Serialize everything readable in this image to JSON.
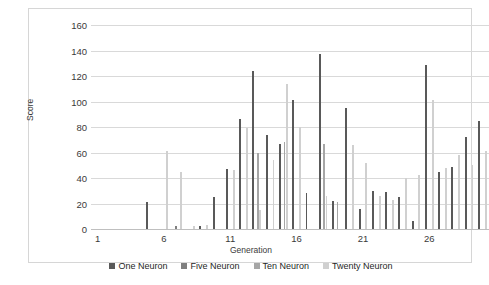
{
  "chart_data": {
    "type": "bar",
    "title": "",
    "xlabel": "Generation",
    "ylabel": "Score",
    "ylim": [
      0,
      160
    ],
    "ytick_values": [
      0,
      20,
      40,
      60,
      80,
      100,
      120,
      140,
      160
    ],
    "xtick_values": [
      1,
      6,
      11,
      16,
      21,
      26
    ],
    "grid": true,
    "legend_position": "bottom",
    "categories": [
      1,
      2,
      3,
      4,
      5,
      6,
      7,
      8,
      9,
      10,
      11,
      12,
      13,
      14,
      15,
      16,
      17,
      18,
      19,
      20,
      21,
      22,
      23,
      24,
      25,
      26,
      27,
      28,
      29,
      30
    ],
    "series": [
      {
        "name": "One Neuron",
        "color": "#595959",
        "values": [
          0,
          0,
          0,
          0,
          21,
          0,
          0,
          0,
          2,
          25,
          47,
          86,
          124,
          74,
          67,
          101,
          28,
          137,
          22,
          95,
          16,
          30,
          29,
          25,
          6,
          129,
          45,
          49,
          72,
          85
        ]
      },
      {
        "name": "Five Neuron",
        "color": "#7f7f7f",
        "values": [
          0,
          0,
          0,
          0,
          0,
          0,
          2,
          0,
          0,
          0,
          0,
          0,
          0,
          0,
          0,
          0,
          0,
          0,
          0,
          0,
          0,
          0,
          0,
          0,
          0,
          0,
          0,
          0,
          0,
          0
        ]
      },
      {
        "name": "Ten Neuron",
        "color": "#a6a6a6",
        "values": [
          0,
          0,
          0,
          0,
          0,
          0,
          0,
          0,
          0,
          0,
          0,
          0,
          60,
          0,
          68,
          0,
          0,
          67,
          21,
          0,
          0,
          0,
          0,
          0,
          0,
          0,
          0,
          0,
          0,
          0
        ]
      },
      {
        "name": "Twenty Neuron",
        "color": "#d0d0d0",
        "values": [
          0,
          0,
          0,
          0,
          0,
          61,
          45,
          2,
          3,
          0,
          46,
          79,
          15,
          54,
          114,
          80,
          0,
          26,
          0,
          66,
          52,
          26,
          23,
          40,
          42,
          101,
          48,
          58,
          50,
          61
        ]
      }
    ]
  },
  "legend": {
    "items": [
      {
        "label": "One Neuron"
      },
      {
        "label": "Five Neuron"
      },
      {
        "label": "Ten Neuron"
      },
      {
        "label": "Twenty Neuron"
      }
    ]
  }
}
